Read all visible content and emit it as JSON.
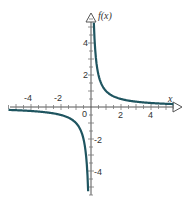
{
  "chart_data": {
    "type": "line",
    "title": "",
    "function": "f(x) = 1/x",
    "xlabel": "x",
    "ylabel": "f(x)",
    "xlim": [
      -5.5,
      5.5
    ],
    "ylim": [
      -5.5,
      5.5
    ],
    "x_tick_labels": [
      "-4",
      "-2",
      "0",
      "2",
      "4"
    ],
    "y_tick_labels": [
      "4",
      "2",
      "-2",
      "-4"
    ],
    "grid": false,
    "series": [
      {
        "name": "f(x)",
        "color": "#1f5560",
        "x": [
          -5.5,
          -4,
          -3,
          -2,
          -1,
          -0.5,
          -0.25,
          -0.2,
          0.2,
          0.25,
          0.5,
          1,
          2,
          3,
          4,
          5.5
        ],
        "y": [
          -0.18,
          -0.25,
          -0.33,
          -0.5,
          -1,
          -2,
          -4,
          -5,
          5,
          4,
          2,
          1,
          0.5,
          0.33,
          0.25,
          0.18
        ]
      }
    ]
  },
  "labels": {
    "x_axis": "x",
    "y_axis": "f(x)",
    "xt": [
      "-4",
      "-2",
      "0",
      "2",
      "4"
    ],
    "yt": [
      "4",
      "2",
      "-2",
      "-4"
    ]
  }
}
